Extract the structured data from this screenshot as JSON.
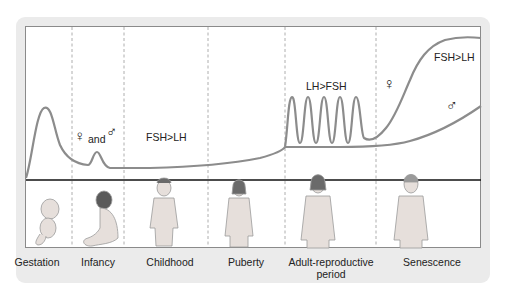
{
  "diagram": {
    "stages": [
      {
        "label": "Gestation",
        "x": 48
      },
      {
        "label": "Infancy",
        "x": 98
      },
      {
        "label": "Childhood",
        "x": 167
      },
      {
        "label": "Puberty",
        "x": 246
      },
      {
        "label": "Adult-reproductive period",
        "x": 331
      },
      {
        "label": "Senescence",
        "x": 432
      }
    ],
    "annotations": {
      "infancy_sexes": "and",
      "childhood_ratio": "FSH>LH",
      "adult_ratio": "LH>FSH",
      "senescence_ratio": "FSH>LH",
      "female_symbol": "♀",
      "male_symbol": "♂"
    },
    "colors": {
      "curve": "#8c8c8c",
      "baseline": "#111111",
      "divider": "#9a9a9a",
      "panel": "#ebebeb"
    }
  }
}
